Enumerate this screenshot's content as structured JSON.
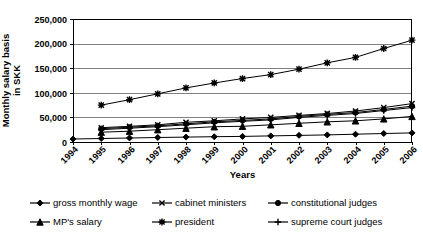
{
  "chart_data": {
    "type": "line",
    "title": "",
    "xlabel": "Years",
    "ylabel": "Monthly salary basis in SKK",
    "ylabel_lines": [
      "Monthly salary basis",
      "in SKK"
    ],
    "grid": true,
    "legend_position": "bottom",
    "xlim": [
      1994,
      2006
    ],
    "ylim": [
      0,
      250000
    ],
    "ytick_labels": [
      "0",
      "50,000",
      "100,000",
      "150,000",
      "200,000",
      "250,000"
    ],
    "yticks": [
      0,
      50000,
      100000,
      150000,
      200000,
      250000
    ],
    "categories": [
      1994,
      1995,
      1996,
      1997,
      1998,
      1999,
      2000,
      2001,
      2002,
      2003,
      2004,
      2005,
      2006
    ],
    "xtick_labels": [
      "1994",
      "1995",
      "1996",
      "1997",
      "1998",
      "1999",
      "2000",
      "2001",
      "2002",
      "2003",
      "2004",
      "2005",
      "2006"
    ],
    "series": [
      {
        "name": "gross monthly wage",
        "marker": "diamond",
        "color": "#000000",
        "values": [
          6000,
          7200,
          8200,
          9200,
          10000,
          10700,
          11400,
          12400,
          13500,
          14400,
          15800,
          17300,
          18500
        ]
      },
      {
        "name": "cabinet ministers",
        "marker": "x",
        "color": "#000000",
        "values": [
          null,
          29000,
          32000,
          35000,
          40000,
          43000,
          47000,
          50000,
          54000,
          58000,
          63000,
          70000,
          78000
        ]
      },
      {
        "name": "constitutional judges",
        "marker": "circle",
        "color": "#000000",
        "values": [
          null,
          27000,
          30000,
          33000,
          37000,
          41000,
          44000,
          47000,
          52000,
          56000,
          60000,
          66000,
          73000
        ]
      },
      {
        "name": "MP's salary",
        "marker": "triangle",
        "color": "#000000",
        "values": [
          null,
          20000,
          22000,
          25000,
          28000,
          31000,
          32000,
          35000,
          38000,
          41000,
          43000,
          47000,
          52000
        ]
      },
      {
        "name": "president",
        "marker": "star",
        "color": "#000000",
        "values": [
          null,
          75000,
          86000,
          98000,
          110000,
          120000,
          129000,
          137000,
          148000,
          161000,
          172000,
          190000,
          207000
        ]
      },
      {
        "name": "supreme court judges",
        "marker": "plus",
        "color": "#000000",
        "values": [
          null,
          25000,
          28000,
          31000,
          35000,
          39000,
          42000,
          45000,
          50000,
          54000,
          58000,
          64000,
          70000
        ]
      }
    ],
    "legend_items": [
      {
        "label": "gross monthly wage",
        "marker": "diamond"
      },
      {
        "label": "cabinet ministers",
        "marker": "x"
      },
      {
        "label": "constitutional judges",
        "marker": "circle"
      },
      {
        "label": "MP's salary",
        "marker": "triangle"
      },
      {
        "label": "president",
        "marker": "star"
      },
      {
        "label": "supreme court judges",
        "marker": "plus"
      }
    ]
  }
}
